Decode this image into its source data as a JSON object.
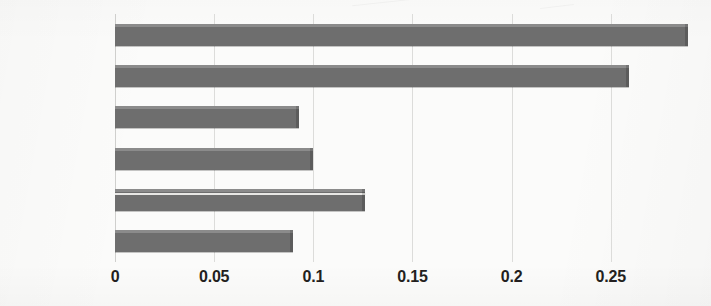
{
  "chart_data": {
    "type": "bar",
    "orientation": "horizontal",
    "title": "",
    "subtitle": "",
    "xlabel": "",
    "ylabel": "",
    "categories": [
      "Right Eye",
      "Left Eye",
      "Mouth Size",
      "D1",
      "Lower Lip",
      "Upper Lip"
    ],
    "values": [
      0.289,
      0.259,
      0.093,
      0.1,
      0.126,
      0.09
    ],
    "series": [
      {
        "name": "",
        "values": [
          0.289,
          0.259,
          0.093,
          0.1,
          0.126,
          0.09
        ]
      }
    ],
    "xlim": [
      0,
      0.2925
    ],
    "xticks": [
      0,
      0.05,
      0.1,
      0.15,
      0.2,
      0.25
    ],
    "xtick_labels": [
      "0",
      "0.05",
      "0.1",
      "0.15",
      "0.2",
      "0.25"
    ],
    "grid": "vertical",
    "legend": "none",
    "bar_color": "#6e6e6e",
    "gridline_color": "#dcdcda",
    "background_color": "#fbfbfa",
    "text_color": "#231f20",
    "annotations": []
  }
}
